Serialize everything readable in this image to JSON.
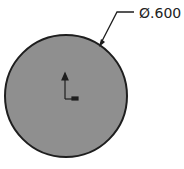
{
  "drawing": {
    "dimension": {
      "label": "Ø.600",
      "type": "diameter"
    },
    "circle": {
      "fill": "#8f8f8f",
      "stroke": "#1e1e1e"
    },
    "origin_marker": {
      "color": "#1e1e1e"
    }
  }
}
